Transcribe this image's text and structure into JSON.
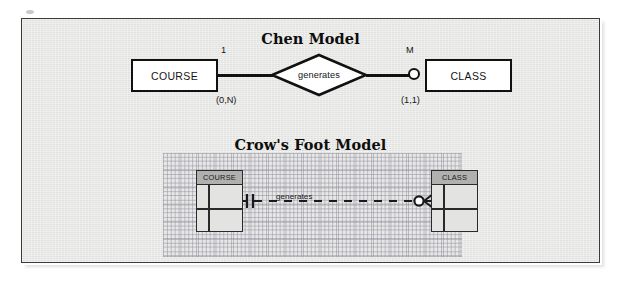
{
  "figure": {
    "background_color": "#ffffff",
    "panel_color": "#e8e8e6",
    "border_color": "#3b3b3b"
  },
  "chen": {
    "title": "Chen Model",
    "left_entity": "COURSE",
    "right_entity": "CLASS",
    "relationship": "generates",
    "left_cardinality_symbol": "1",
    "left_participation": "(0,N)",
    "right_cardinality_symbol": "M",
    "right_participation": "(1,1)",
    "optional_circle": "hollow-circle-optional-participation"
  },
  "crowsfoot": {
    "title": "Crow's Foot Model",
    "left_entity": "COURSE",
    "right_entity": "CLASS",
    "relationship": "generates",
    "left_connector": "one-and-only-one",
    "right_connector": "zero-or-many",
    "line_style": "dashed",
    "grid": "dotted-canvas-grid"
  }
}
